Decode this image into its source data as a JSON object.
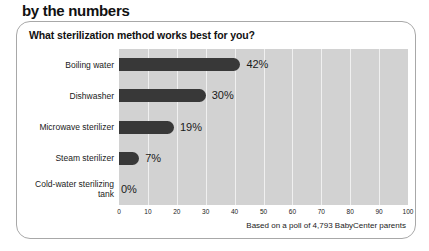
{
  "kicker": "by the numbers",
  "card": {
    "question": "What sterilization method works best for you?",
    "footnote": "Based on a poll of 4,793 BabyCenter parents"
  },
  "colors": {
    "bar": "#383838",
    "plot_background": "#d2d2d2",
    "gridline": "#f0f0f0",
    "card_border": "#a8a8a8",
    "text": "#1a1a1a"
  },
  "chart_data": {
    "type": "bar",
    "orientation": "horizontal",
    "title": "What sterilization method works best for you?",
    "categories": [
      "Boiling water",
      "Dishwasher",
      "Microwave sterilizer",
      "Steam sterilizer",
      "Cold-water sterilizing tank"
    ],
    "values": [
      42,
      30,
      19,
      7,
      0
    ],
    "value_labels": [
      "42%",
      "30%",
      "19%",
      "7%",
      "0%"
    ],
    "xlabel": "",
    "ylabel": "",
    "xlim": [
      0,
      100
    ],
    "xticks": [
      0,
      10,
      20,
      30,
      40,
      50,
      60,
      70,
      80,
      90,
      100
    ],
    "xtick_labels": [
      "0",
      "10",
      "20",
      "30",
      "40",
      "50",
      "60",
      "70",
      "80",
      "90",
      "100"
    ],
    "grid": "vertical",
    "legend": "none",
    "annotation": "Based on a poll of 4,793 BabyCenter parents"
  }
}
